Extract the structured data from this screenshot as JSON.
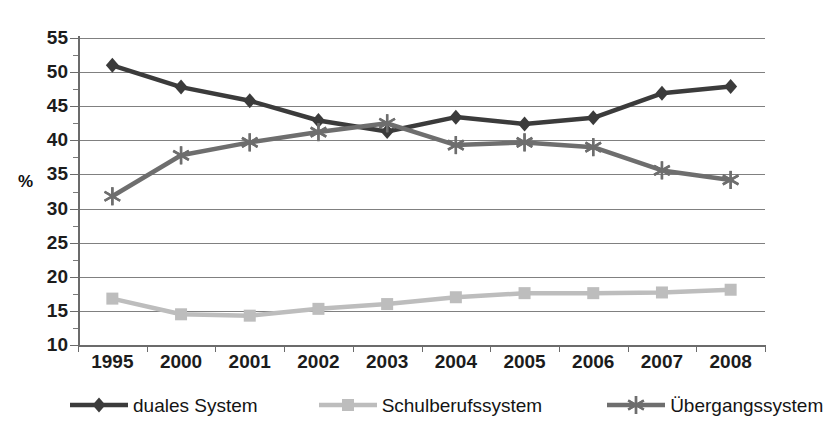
{
  "chart_data": {
    "type": "line",
    "title": "",
    "subtitle": "",
    "xlabel": "",
    "ylabel": "%",
    "ylim": [
      10,
      55
    ],
    "ytick_step": 5,
    "grid": true,
    "legend_position": "bottom",
    "categories": [
      "1995",
      "2000",
      "2001",
      "2002",
      "2003",
      "2004",
      "2005",
      "2006",
      "2007",
      "2008"
    ],
    "ytick_labels": [
      "55",
      "50",
      "45",
      "40",
      "35",
      "30",
      "25",
      "20",
      "15",
      "10"
    ],
    "series": [
      {
        "name": "duales System",
        "marker": "diamond",
        "color": "#3b3b3b",
        "values": [
          51.0,
          47.8,
          45.8,
          42.9,
          41.3,
          43.4,
          42.4,
          43.3,
          46.9,
          47.9
        ]
      },
      {
        "name": "Schulberufssystem",
        "marker": "square",
        "color": "#bdbdbd",
        "values": [
          16.8,
          14.5,
          14.3,
          15.3,
          16.0,
          17.0,
          17.6,
          17.6,
          17.7,
          18.1
        ]
      },
      {
        "name": "Übergangssystem",
        "marker": "asterisk",
        "color": "#6e6e6e",
        "values": [
          31.8,
          37.8,
          39.7,
          41.2,
          42.5,
          39.3,
          39.7,
          39.0,
          35.6,
          34.2
        ]
      }
    ]
  },
  "axis": {
    "y_title": "%"
  },
  "legend": {
    "entries": [
      {
        "label": "duales System"
      },
      {
        "label": "Schulberufssystem"
      },
      {
        "label": "Übergangssystem"
      }
    ]
  }
}
